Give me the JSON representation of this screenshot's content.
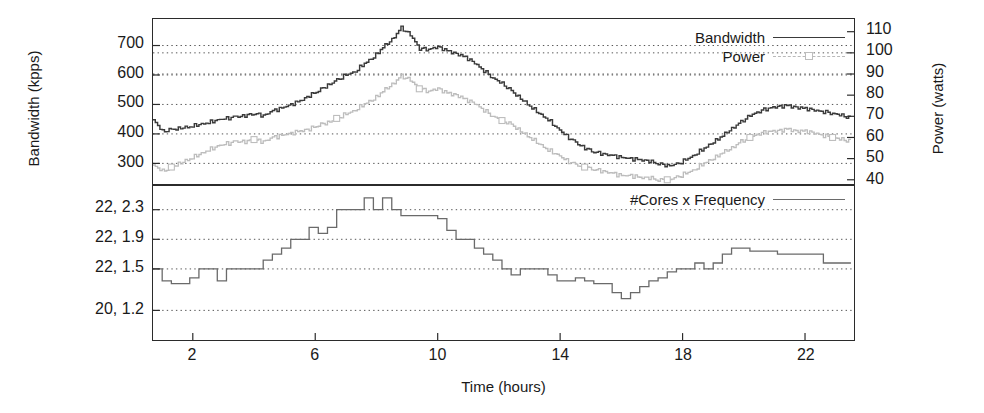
{
  "figure": {
    "xlabel": "Time (hours)",
    "ylabel_left": "Bandwidth (kpps)",
    "ylabel_right": "Power (watts)"
  },
  "legend_top": {
    "bandwidth": "Bandwidth",
    "power": "Power"
  },
  "legend_bottom": {
    "cores_freq": "#Cores x Frequency"
  },
  "ticks": {
    "x": [
      "2",
      "6",
      "10",
      "14",
      "18",
      "22"
    ],
    "y_left_top": [
      "700",
      "600",
      "500",
      "400",
      "300"
    ],
    "y_right_top": [
      "110",
      "100",
      "90",
      "80",
      "70",
      "60",
      "50",
      "40"
    ],
    "y_left_bottom": [
      "22, 2.3",
      "22, 1.9",
      "22, 1.5",
      "20, 1.2"
    ]
  },
  "colors": {
    "bandwidth": "#3a3a3a",
    "power": "#bdbdbd",
    "cores": "#6a6a6a",
    "axis": "#2b2b2b",
    "grid": "#555555"
  },
  "chart_data": [
    {
      "type": "line",
      "title": "",
      "panel": "top",
      "xlabel": "Time (hours)",
      "ylabel": "Bandwidth (kpps)",
      "ylabel_secondary": "Power (watts)",
      "xlim": [
        0.7,
        23.6
      ],
      "ylim": [
        230,
        790
      ],
      "ylim_secondary": [
        38,
        116
      ],
      "grid": true,
      "legend_position": "top-right",
      "xticks": [
        2,
        6,
        10,
        14,
        18,
        22
      ],
      "yticks": [
        300,
        400,
        500,
        600,
        700
      ],
      "yticks_secondary": [
        40,
        50,
        60,
        70,
        80,
        90,
        100,
        110
      ],
      "x": [
        0.7,
        1.0,
        1.3,
        1.6,
        1.9,
        2.2,
        2.5,
        2.8,
        3.1,
        3.4,
        3.7,
        4.0,
        4.3,
        4.6,
        4.9,
        5.2,
        5.5,
        5.8,
        6.1,
        6.4,
        6.7,
        7.0,
        7.3,
        7.6,
        7.9,
        8.2,
        8.5,
        8.8,
        9.1,
        9.4,
        9.7,
        10.0,
        10.3,
        10.6,
        10.9,
        11.2,
        11.5,
        11.8,
        12.1,
        12.4,
        12.7,
        13.0,
        13.3,
        13.6,
        13.9,
        14.2,
        14.5,
        14.8,
        15.1,
        15.4,
        15.7,
        16.0,
        16.3,
        16.6,
        16.9,
        17.2,
        17.5,
        17.8,
        18.1,
        18.4,
        18.7,
        19.0,
        19.3,
        19.6,
        19.9,
        20.2,
        20.5,
        20.8,
        21.1,
        21.4,
        21.7,
        22.0,
        22.3,
        22.6,
        22.9,
        23.2,
        23.5
      ],
      "series": [
        {
          "name": "Bandwidth",
          "unit": "kpps",
          "axis": "left",
          "style": "solid",
          "values": [
            448,
            408,
            414,
            420,
            425,
            432,
            438,
            448,
            452,
            458,
            462,
            470,
            462,
            478,
            488,
            500,
            512,
            530,
            548,
            565,
            582,
            600,
            612,
            640,
            660,
            695,
            720,
            760,
            735,
            690,
            688,
            695,
            682,
            672,
            660,
            640,
            615,
            590,
            570,
            545,
            520,
            495,
            470,
            448,
            420,
            392,
            370,
            352,
            340,
            332,
            326,
            320,
            316,
            312,
            308,
            300,
            292,
            296,
            312,
            330,
            352,
            372,
            395,
            418,
            440,
            462,
            478,
            488,
            492,
            496,
            490,
            486,
            480,
            476,
            470,
            462,
            452
          ]
        },
        {
          "name": "Power",
          "unit": "watts",
          "axis": "right",
          "style": "dashed-marker",
          "values": [
            47,
            44,
            46,
            48,
            50,
            52,
            54,
            56,
            57,
            58,
            58,
            59,
            58,
            60,
            61,
            62,
            63,
            64,
            66,
            67,
            69,
            71,
            73,
            76,
            78,
            82,
            85,
            89,
            87,
            83,
            82,
            83,
            81,
            80,
            78,
            76,
            73,
            70,
            68,
            66,
            63,
            60,
            57,
            54,
            52,
            49,
            47,
            46,
            45,
            44,
            43,
            42,
            42,
            41,
            41,
            40,
            40,
            41,
            43,
            45,
            48,
            50,
            53,
            55,
            58,
            60,
            62,
            63,
            63,
            64,
            63,
            63,
            62,
            61,
            60,
            59,
            58
          ]
        }
      ]
    },
    {
      "type": "line",
      "panel": "bottom",
      "style": "step",
      "xlabel": "Time (hours)",
      "ylabel": "#Cores x Frequency",
      "xlim": [
        0.7,
        23.6
      ],
      "ylim": [
        0,
        5.2
      ],
      "grid": true,
      "legend_position": "top-right",
      "xticks": [
        2,
        6,
        10,
        14,
        18,
        22
      ],
      "ytick_positions": [
        4.4,
        3.4,
        2.4,
        1.0
      ],
      "ytick_labels": [
        "22, 2.3",
        "22, 1.9",
        "22, 1.5",
        "20, 1.2"
      ],
      "series": [
        {
          "name": "#Cores x Frequency",
          "x": [
            0.7,
            1.0,
            1.3,
            1.6,
            1.9,
            2.2,
            2.5,
            2.8,
            3.1,
            3.4,
            3.7,
            4.0,
            4.3,
            4.6,
            4.9,
            5.2,
            5.5,
            5.8,
            6.1,
            6.4,
            6.7,
            7.0,
            7.3,
            7.6,
            7.9,
            8.2,
            8.5,
            8.8,
            9.1,
            9.4,
            9.7,
            10.0,
            10.3,
            10.6,
            10.9,
            11.2,
            11.5,
            11.8,
            12.1,
            12.4,
            12.7,
            13.0,
            13.3,
            13.6,
            13.9,
            14.2,
            14.5,
            14.8,
            15.1,
            15.4,
            15.7,
            16.0,
            16.3,
            16.6,
            16.9,
            17.2,
            17.5,
            17.8,
            18.1,
            18.4,
            18.7,
            19.0,
            19.3,
            19.6,
            19.9,
            20.2,
            20.5,
            20.8,
            21.1,
            21.4,
            21.7,
            22.0,
            22.3,
            22.6,
            22.9,
            23.2,
            23.5
          ],
          "values": [
            2.4,
            2.0,
            1.9,
            1.9,
            2.1,
            2.4,
            2.4,
            2.0,
            2.4,
            2.4,
            2.4,
            2.4,
            2.7,
            2.9,
            3.1,
            3.4,
            3.4,
            3.8,
            3.6,
            3.8,
            4.4,
            4.4,
            4.4,
            4.8,
            4.4,
            4.8,
            4.4,
            4.2,
            4.2,
            4.2,
            4.2,
            4.1,
            3.7,
            3.4,
            3.4,
            3.1,
            2.9,
            2.7,
            2.4,
            2.2,
            2.4,
            2.4,
            2.4,
            2.2,
            2.0,
            2.0,
            2.1,
            2.0,
            1.9,
            1.9,
            1.6,
            1.4,
            1.6,
            1.8,
            2.0,
            2.1,
            2.3,
            2.4,
            2.4,
            2.6,
            2.4,
            2.6,
            2.9,
            3.1,
            3.1,
            3.0,
            3.0,
            3.0,
            2.9,
            2.9,
            2.9,
            2.9,
            2.9,
            2.6,
            2.6,
            2.6,
            2.6
          ]
        }
      ]
    }
  ]
}
